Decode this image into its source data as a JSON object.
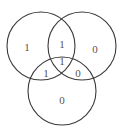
{
  "diagram": {
    "type": "venn",
    "sets": 3,
    "colors": {
      "stroke": "#3a3a3a",
      "text": "#555555",
      "background": "#ffffff"
    },
    "circles": [
      {
        "name": "top-left",
        "cx": 41,
        "cy": 46,
        "r": 34
      },
      {
        "name": "top-right",
        "cx": 82,
        "cy": 46,
        "r": 34
      },
      {
        "name": "bottom",
        "cx": 62,
        "cy": 91,
        "r": 34
      }
    ],
    "regions": {
      "left_only": "1",
      "right_only": "0",
      "bottom_only": "0",
      "left_right": "1",
      "left_bottom": "1",
      "right_bottom": "0",
      "all_three": "1"
    }
  }
}
